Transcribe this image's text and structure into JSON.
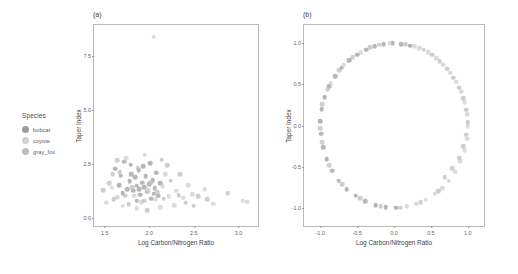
{
  "legend": {
    "title": "Species",
    "items": [
      {
        "label": "bobcat",
        "color": "#9d9d9d"
      },
      {
        "label": "coyote",
        "color": "#cfcfcf"
      },
      {
        "label": "gray_fox",
        "color": "#bdbdbd"
      }
    ]
  },
  "panels": [
    {
      "tag": "(a)"
    },
    {
      "tag": "(b)"
    }
  ],
  "chart_data": [
    {
      "type": "scatter",
      "panel": "(a)",
      "title": "(a)",
      "xlabel": "Log Carbon/Nitrogen Ratio",
      "ylabel": "Taper Index",
      "xlim": [
        1.38,
        3.22
      ],
      "ylim": [
        -0.35,
        8.95
      ],
      "xticks": [
        1.5,
        2.0,
        2.5,
        3.0
      ],
      "yticks": [
        0.0,
        2.5,
        5.0,
        7.5
      ],
      "xticklabels": [
        "1.5",
        "2.0",
        "2.5",
        "3.0"
      ],
      "yticklabels": [
        "0.0",
        "2.5",
        "5.0",
        "7.5"
      ],
      "grid": false,
      "legend_position": "left-outside",
      "series": [
        {
          "name": "bobcat",
          "color": "#9d9d9d",
          "points": [
            [
              1.62,
              2.3
            ],
            [
              1.68,
              1.98
            ],
            [
              1.72,
              2.62
            ],
            [
              1.75,
              1.35
            ],
            [
              1.78,
              1.72
            ],
            [
              1.8,
              2.05
            ],
            [
              1.82,
              1.28
            ],
            [
              1.84,
              1.9
            ],
            [
              1.86,
              1.52
            ],
            [
              1.88,
              2.22
            ],
            [
              1.9,
              1.1
            ],
            [
              1.92,
              1.66
            ],
            [
              1.94,
              1.44
            ],
            [
              1.96,
              1.95
            ],
            [
              1.98,
              1.24
            ],
            [
              2.0,
              1.58
            ],
            [
              2.02,
              0.92
            ],
            [
              2.04,
              1.78
            ],
            [
              2.06,
              1.4
            ],
            [
              2.08,
              2.12
            ],
            [
              2.1,
              1.05
            ],
            [
              1.7,
              1.18
            ],
            [
              1.86,
              0.82
            ],
            [
              1.93,
              2.42
            ],
            [
              2.01,
              2.55
            ],
            [
              1.79,
              2.48
            ],
            [
              2.12,
              1.62
            ],
            [
              1.66,
              1.55
            ],
            [
              2.05,
              1.15
            ],
            [
              1.89,
              1.35
            ]
          ]
        },
        {
          "name": "coyote",
          "color": "#cfcfcf",
          "points": [
            [
              1.58,
              1.42
            ],
            [
              1.64,
              0.98
            ],
            [
              1.74,
              2.8
            ],
            [
              1.83,
              1.05
            ],
            [
              1.91,
              0.75
            ],
            [
              1.99,
              1.32
            ],
            [
              2.07,
              0.88
            ],
            [
              2.15,
              1.48
            ],
            [
              2.22,
              1.02
            ],
            [
              2.3,
              1.28
            ],
            [
              2.38,
              0.95
            ],
            [
              2.48,
              1.12
            ],
            [
              2.05,
              8.4
            ],
            [
              1.95,
              2.95
            ],
            [
              2.18,
              2.05
            ],
            [
              2.28,
              0.62
            ],
            [
              1.52,
              0.72
            ],
            [
              3.05,
              0.82
            ],
            [
              3.1,
              0.78
            ],
            [
              2.62,
              1.35
            ],
            [
              2.72,
              0.68
            ],
            [
              1.7,
              0.58
            ],
            [
              2.44,
              1.55
            ],
            [
              2.12,
              0.52
            ],
            [
              1.86,
              0.48
            ]
          ]
        },
        {
          "name": "gray_fox",
          "color": "#bdbdbd",
          "points": [
            [
              1.48,
              1.32
            ],
            [
              1.55,
              1.62
            ],
            [
              1.6,
              0.88
            ],
            [
              1.67,
              2.15
            ],
            [
              1.73,
              1.05
            ],
            [
              1.81,
              1.45
            ],
            [
              1.87,
              2.35
            ],
            [
              1.94,
              0.82
            ],
            [
              2.02,
              1.68
            ],
            [
              2.09,
              1.22
            ],
            [
              2.16,
              0.92
            ],
            [
              2.24,
              1.75
            ],
            [
              2.33,
              1.08
            ],
            [
              2.41,
              0.72
            ],
            [
              2.55,
              1.02
            ],
            [
              2.65,
              0.88
            ],
            [
              2.88,
              1.18
            ],
            [
              1.64,
              2.7
            ],
            [
              2.2,
              2.45
            ],
            [
              1.77,
              0.65
            ],
            [
              2.35,
              2.05
            ],
            [
              1.98,
              0.38
            ],
            [
              2.14,
              2.72
            ],
            [
              1.59,
              2.05
            ],
            [
              2.5,
              0.58
            ]
          ]
        }
      ]
    },
    {
      "type": "scatter",
      "panel": "(b)",
      "title": "(b)",
      "xlabel": "Log Carbon/Nitrogen Ratio",
      "ylabel": "Taper Index",
      "xlim": [
        -1.22,
        1.22
      ],
      "ylim": [
        -1.22,
        1.22
      ],
      "xticks": [
        -1.0,
        -0.5,
        0.0,
        0.5,
        1.0
      ],
      "yticks": [
        -1.0,
        -0.5,
        0.0,
        0.5,
        1.0
      ],
      "xticklabels": [
        "-1.0",
        "-0.5",
        "0.0",
        "0.5",
        "1.0"
      ],
      "yticklabels": [
        "-1.0",
        "-0.5",
        "0.0",
        "0.5",
        "1.0"
      ],
      "grid": false,
      "legend_position": "none",
      "series": [
        {
          "name": "bobcat",
          "color": "#9d9d9d",
          "points": [
            [
              -0.02,
              1.0
            ],
            [
              0.1,
              0.99
            ],
            [
              0.22,
              0.97
            ],
            [
              -0.14,
              0.99
            ],
            [
              -0.26,
              0.96
            ],
            [
              -0.38,
              0.92
            ],
            [
              -0.5,
              0.86
            ],
            [
              -0.61,
              0.79
            ],
            [
              -0.71,
              0.7
            ],
            [
              -0.8,
              0.6
            ],
            [
              -0.88,
              0.48
            ],
            [
              -0.94,
              0.34
            ],
            [
              -0.98,
              0.2
            ],
            [
              -1.0,
              0.05
            ],
            [
              -0.99,
              -0.1
            ],
            [
              -0.96,
              -0.26
            ],
            [
              -0.91,
              -0.41
            ],
            [
              -0.84,
              -0.55
            ],
            [
              -0.75,
              -0.67
            ],
            [
              -0.64,
              -0.77
            ],
            [
              -0.52,
              -0.85
            ],
            [
              -0.39,
              -0.92
            ],
            [
              -0.25,
              -0.97
            ],
            [
              -0.11,
              -0.99
            ],
            [
              0.03,
              -1.0
            ]
          ]
        },
        {
          "name": "coyote",
          "color": "#cfcfcf",
          "points": [
            [
              0.34,
              0.94
            ],
            [
              0.46,
              0.89
            ],
            [
              0.57,
              0.82
            ],
            [
              0.67,
              0.74
            ],
            [
              0.76,
              0.64
            ],
            [
              0.84,
              0.53
            ],
            [
              0.91,
              0.41
            ],
            [
              0.96,
              0.28
            ],
            [
              0.99,
              0.14
            ],
            [
              1.0,
              -0.01
            ],
            [
              0.99,
              -0.16
            ],
            [
              0.96,
              -0.3
            ],
            [
              0.9,
              -0.43
            ],
            [
              0.83,
              -0.56
            ],
            [
              0.74,
              -0.67
            ],
            [
              0.17,
              -0.98
            ],
            [
              0.3,
              -0.95
            ],
            [
              0.43,
              -0.9
            ],
            [
              0.55,
              -0.83
            ],
            [
              0.65,
              -0.76
            ],
            [
              -0.06,
              1.0
            ],
            [
              0.28,
              0.96
            ],
            [
              -0.45,
              0.89
            ],
            [
              -0.68,
              0.73
            ],
            [
              -0.86,
              0.51
            ]
          ]
        },
        {
          "name": "gray_fox",
          "color": "#bdbdbd",
          "points": [
            [
              0.16,
              0.99
            ],
            [
              0.4,
              0.92
            ],
            [
              0.52,
              0.86
            ],
            [
              0.62,
              0.78
            ],
            [
              0.72,
              0.69
            ],
            [
              0.8,
              0.58
            ],
            [
              0.88,
              0.46
            ],
            [
              0.94,
              0.33
            ],
            [
              0.98,
              0.19
            ],
            [
              1.0,
              0.04
            ],
            [
              0.98,
              -0.11
            ],
            [
              0.94,
              -0.25
            ],
            [
              0.88,
              -0.39
            ],
            [
              0.79,
              -0.52
            ],
            [
              0.69,
              -0.63
            ],
            [
              -0.32,
              0.95
            ],
            [
              -0.56,
              0.83
            ],
            [
              -0.74,
              0.67
            ],
            [
              -0.9,
              0.44
            ],
            [
              -0.97,
              0.26
            ],
            [
              -1.0,
              -0.03
            ],
            [
              -0.97,
              -0.2
            ],
            [
              -0.88,
              -0.48
            ],
            [
              -0.7,
              -0.71
            ],
            [
              -0.46,
              -0.88
            ],
            [
              -0.18,
              -0.98
            ],
            [
              0.09,
              -1.0
            ],
            [
              0.36,
              -0.93
            ],
            [
              0.6,
              -0.8
            ],
            [
              -0.2,
              0.98
            ]
          ]
        }
      ]
    }
  ]
}
